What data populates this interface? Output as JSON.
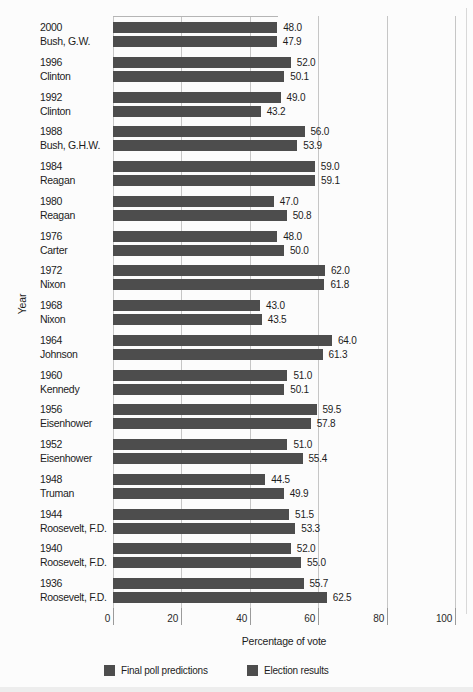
{
  "chart_data": {
    "type": "bar",
    "orientation": "horizontal",
    "xlabel": "Percentage of vote",
    "ylabel": "Year",
    "xlim": [
      0,
      100
    ],
    "xticks": [
      "0",
      "20",
      "40",
      "60",
      "80",
      "100"
    ],
    "xtick_values": [
      0,
      20,
      40,
      60,
      80,
      100
    ],
    "grid": "vertical",
    "legend_position": "bottom",
    "bar_color": "#4d4d4d",
    "value_label_format": "one-decimal",
    "categories": [
      {
        "year": "2000",
        "president": "Bush, G.W."
      },
      {
        "year": "1996",
        "president": "Clinton"
      },
      {
        "year": "1992",
        "president": "Clinton"
      },
      {
        "year": "1988",
        "president": "Bush, G.H.W."
      },
      {
        "year": "1984",
        "president": "Reagan"
      },
      {
        "year": "1980",
        "president": "Reagan"
      },
      {
        "year": "1976",
        "president": "Carter"
      },
      {
        "year": "1972",
        "president": "Nixon"
      },
      {
        "year": "1968",
        "president": "Nixon"
      },
      {
        "year": "1964",
        "president": "Johnson"
      },
      {
        "year": "1960",
        "president": "Kennedy"
      },
      {
        "year": "1956",
        "president": "Eisenhower"
      },
      {
        "year": "1952",
        "president": "Eisenhower"
      },
      {
        "year": "1948",
        "president": "Truman"
      },
      {
        "year": "1944",
        "president": "Roosevelt, F.D."
      },
      {
        "year": "1940",
        "president": "Roosevelt, F.D."
      },
      {
        "year": "1936",
        "president": "Roosevelt, F.D."
      }
    ],
    "series": [
      {
        "name": "Final poll predictions",
        "color": "#4d4d4d",
        "values": [
          48.0,
          52.0,
          49.0,
          56.0,
          59.0,
          47.0,
          48.0,
          62.0,
          43.0,
          64.0,
          51.0,
          59.5,
          51.0,
          44.5,
          51.5,
          52.0,
          55.7
        ]
      },
      {
        "name": "Election results",
        "color": "#4d4d4d",
        "values": [
          47.9,
          50.1,
          43.2,
          53.9,
          59.1,
          50.8,
          50.0,
          61.8,
          43.5,
          61.3,
          50.1,
          57.8,
          55.4,
          49.9,
          53.3,
          55.0,
          62.5
        ]
      }
    ]
  }
}
